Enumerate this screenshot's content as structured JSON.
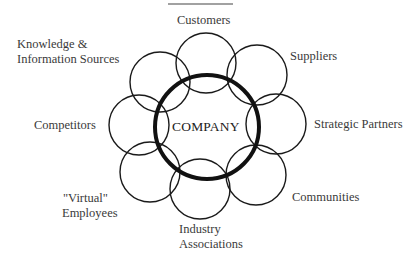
{
  "diagram": {
    "center": {
      "label": "COMPANY"
    },
    "nodes": [
      {
        "id": "customers",
        "label": "Customers"
      },
      {
        "id": "suppliers",
        "label": "Suppliers"
      },
      {
        "id": "strategic-partners",
        "label": "Strategic Partners"
      },
      {
        "id": "communities",
        "label": "Communities"
      },
      {
        "id": "industry-associations",
        "line1": "Industry",
        "line2": "Associations"
      },
      {
        "id": "virtual-employees",
        "line1": "\"Virtual\"",
        "line2": "Employees"
      },
      {
        "id": "competitors",
        "label": "Competitors"
      },
      {
        "id": "knowledge-information-sources",
        "line1": "Knowledge &",
        "line2": "Information Sources"
      }
    ],
    "colors": {
      "stroke": "#1a1a1a",
      "text": "#3a3a3a",
      "background": "#ffffff"
    }
  }
}
